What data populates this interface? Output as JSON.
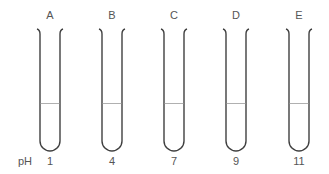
{
  "diagram": {
    "row_label": "pH",
    "tubes": [
      {
        "label": "A",
        "ph": "1",
        "cx": 50
      },
      {
        "label": "B",
        "ph": "4",
        "cx": 112
      },
      {
        "label": "C",
        "ph": "7",
        "cx": 174
      },
      {
        "label": "D",
        "ph": "9",
        "cx": 236
      },
      {
        "label": "E",
        "ph": "11",
        "cx": 299
      }
    ],
    "colors": {
      "tube_outline": "#404040",
      "liquid_line": "#b0b0b0",
      "text": "#555555"
    }
  }
}
